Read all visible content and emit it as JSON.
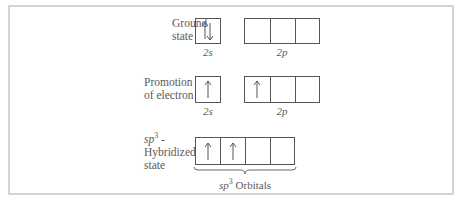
{
  "rows": [
    {
      "label_line1": "Ground",
      "label_line2": "state",
      "s_label": "2s",
      "p_label": "2p",
      "s_electrons": "up-down",
      "p_electrons": [
        "",
        "",
        ""
      ]
    },
    {
      "label_line1": "Promotion",
      "label_line2": "of electron",
      "s_label": "2s",
      "p_label": "2p",
      "s_electrons": "up",
      "p_electrons": [
        "up",
        "",
        ""
      ]
    },
    {
      "label_line1": "sp",
      "label_sup": "3",
      "label_line1_suffix": " -",
      "label_line2": "Hybridized",
      "label_line3": "state",
      "hybrid_electrons": [
        "up",
        "up",
        "",
        ""
      ],
      "brace_label": "sp",
      "brace_sup": "3",
      "brace_suffix": " Orbitals"
    }
  ]
}
